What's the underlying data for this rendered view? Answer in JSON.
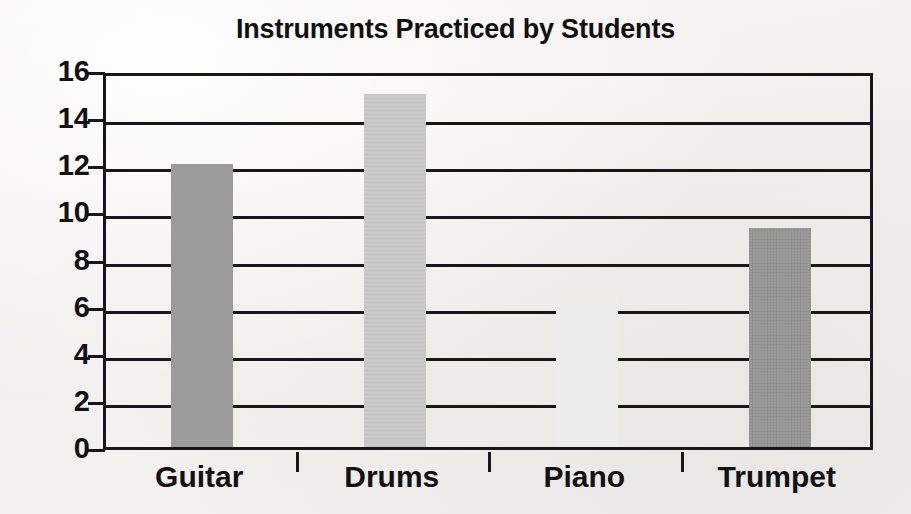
{
  "chart_data": {
    "type": "bar",
    "title": "Instruments Practiced by Students",
    "xlabel": "",
    "ylabel": "",
    "categories": [
      "Guitar",
      "Drums",
      "Piano",
      "Trumpet"
    ],
    "values": [
      12,
      15,
      6.4,
      9.3
    ],
    "series": [
      {
        "name": "Students",
        "values": [
          12,
          15,
          6.4,
          9.3
        ]
      }
    ],
    "ylim": [
      0,
      16
    ],
    "ytick_labels": [
      "0",
      "2",
      "4",
      "6",
      "8",
      "10",
      "12",
      "14",
      "16"
    ],
    "ytick_values": [
      0,
      2,
      4,
      6,
      8,
      10,
      12,
      14,
      16
    ],
    "grid": true,
    "grid_axis": "y",
    "legend": false,
    "legend_position": "none",
    "bar_colors": [
      "#9b9b9b",
      "#c9c9c9",
      "#ececec",
      "#9a9a9a"
    ],
    "axis_color": "#17161a",
    "background_color": "#f4f3f1",
    "bars": [
      {
        "category": "Guitar",
        "value": 12,
        "color": "#9b9b9b"
      },
      {
        "category": "Drums",
        "value": 15,
        "color": "#c9c9c9"
      },
      {
        "category": "Piano",
        "value": 6.4,
        "color": "#ececec"
      },
      {
        "category": "Trumpet",
        "value": 9.3,
        "color": "#9a9a9a"
      }
    ]
  }
}
